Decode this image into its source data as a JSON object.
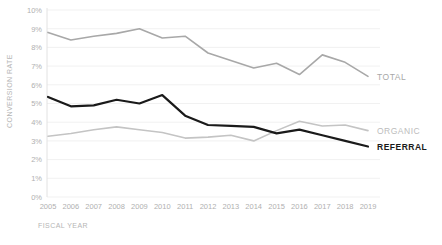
{
  "chart_data": {
    "type": "line",
    "title": "",
    "xlabel": "FISCAL YEAR",
    "ylabel": "CONVERSION RATE",
    "categories": [
      "2005",
      "2006",
      "2007",
      "2008",
      "2009",
      "2010",
      "2011",
      "2012",
      "2013",
      "2014",
      "2015",
      "2016",
      "2017",
      "2018",
      "2019"
    ],
    "x": [
      2005,
      2006,
      2007,
      2008,
      2009,
      2010,
      2011,
      2012,
      2013,
      2014,
      2015,
      2016,
      2017,
      2018,
      2019
    ],
    "ylim": [
      0,
      10
    ],
    "xlim": [
      2005,
      2019
    ],
    "ytick_labels": [
      "0%",
      "1%",
      "2%",
      "3%",
      "4%",
      "5%",
      "6%",
      "7%",
      "8%",
      "9%",
      "10%"
    ],
    "ytick_values": [
      0,
      1,
      2,
      3,
      4,
      5,
      6,
      7,
      8,
      9,
      10
    ],
    "grid": true,
    "grid_axis": "y",
    "legend": "inline-right-end-labels",
    "series": [
      {
        "name": "TOTAL",
        "color": "#a8a8a8",
        "width": 1.6,
        "values": [
          8.8,
          8.4,
          8.6,
          8.75,
          9.0,
          8.5,
          8.6,
          7.7,
          7.3,
          6.9,
          7.15,
          6.55,
          7.6,
          7.2,
          6.45
        ]
      },
      {
        "name": "ORGANIC",
        "color": "#c4c4c4",
        "width": 1.6,
        "values": [
          3.25,
          3.4,
          3.6,
          3.75,
          3.6,
          3.45,
          3.15,
          3.2,
          3.3,
          3.0,
          3.55,
          4.05,
          3.8,
          3.85,
          3.55
        ]
      },
      {
        "name": "REFERRAL",
        "color": "#1a1a1a",
        "width": 2.2,
        "values": [
          5.35,
          4.85,
          4.9,
          5.2,
          5.0,
          5.45,
          4.35,
          3.85,
          3.8,
          3.75,
          3.4,
          3.6,
          3.3,
          3.0,
          2.7
        ]
      }
    ]
  },
  "axes": {
    "y_title": "CONVERSION RATE",
    "x_title": "FISCAL YEAR"
  }
}
